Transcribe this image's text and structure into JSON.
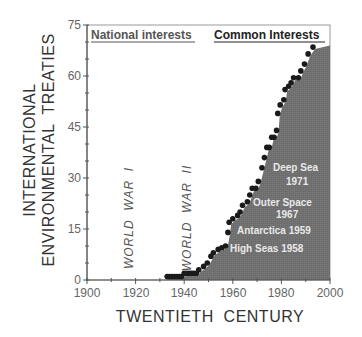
{
  "chart_data": {
    "type": "scatter",
    "title": "",
    "xlabel": "TWENTIETH  CENTURY",
    "ylabel_lines": [
      "INTERNATIONAL",
      "ENVIRONMENTAL  TREATIES"
    ],
    "xlim": [
      1900,
      2000
    ],
    "ylim": [
      0,
      75
    ],
    "x_ticks": [
      1900,
      1920,
      1940,
      1960,
      1980,
      2000
    ],
    "x_minor_step": 10,
    "y_ticks": [
      0,
      15,
      30,
      45,
      60,
      75
    ],
    "y_minor_step": 5,
    "grid": false,
    "legend": null,
    "series": [
      {
        "name": "Cumulative international environmental treaties",
        "marker": "circle",
        "color": "#1a1a1a",
        "fill_under": "#6e6e6e",
        "points": [
          [
            1933,
            1
          ],
          [
            1934,
            1
          ],
          [
            1935,
            1
          ],
          [
            1936,
            1
          ],
          [
            1937,
            1
          ],
          [
            1938,
            1
          ],
          [
            1939,
            1
          ],
          [
            1940,
            2
          ],
          [
            1941,
            2
          ],
          [
            1942,
            2
          ],
          [
            1943,
            2
          ],
          [
            1944,
            2
          ],
          [
            1945,
            2
          ],
          [
            1946,
            3
          ],
          [
            1948,
            4
          ],
          [
            1949.5,
            5
          ],
          [
            1951,
            7
          ],
          [
            1952,
            8
          ],
          [
            1954,
            9
          ],
          [
            1955.5,
            9.5
          ],
          [
            1957,
            10
          ],
          [
            1958,
            14
          ],
          [
            1958.5,
            17
          ],
          [
            1960,
            18
          ],
          [
            1962,
            19
          ],
          [
            1963,
            20
          ],
          [
            1964,
            22
          ],
          [
            1966,
            23
          ],
          [
            1967,
            25
          ],
          [
            1968,
            27
          ],
          [
            1969.5,
            27
          ],
          [
            1970.5,
            29
          ],
          [
            1972,
            33
          ],
          [
            1973,
            36
          ],
          [
            1974,
            39
          ],
          [
            1975,
            39
          ],
          [
            1976,
            42
          ],
          [
            1977,
            42
          ],
          [
            1978,
            44
          ],
          [
            1978.5,
            49
          ],
          [
            1979.5,
            51.5
          ],
          [
            1981,
            53
          ],
          [
            1981.5,
            56
          ],
          [
            1983,
            57
          ],
          [
            1984,
            58
          ],
          [
            1985,
            59.5
          ],
          [
            1987,
            59.5
          ],
          [
            1988,
            61.5
          ],
          [
            1989.5,
            63.5
          ],
          [
            1991,
            66.5
          ],
          [
            1993,
            68.5
          ]
        ],
        "fill_end": [
          2000,
          69
        ]
      }
    ],
    "annotations": [
      {
        "text": "National interests",
        "position": "top-left",
        "style": "bold-underline"
      },
      {
        "text": "Common Interests",
        "position": "top-right",
        "style": "bold-underline"
      },
      {
        "text": "WORLD WAR I",
        "x": 1917,
        "rotation": -90
      },
      {
        "text": "WORLD WAR II",
        "x": 1941,
        "rotation": -90
      },
      {
        "text": "High Seas 1958",
        "x": 1975,
        "y": 9.5
      },
      {
        "text": "Antarctica 1959",
        "x": 1978,
        "y": 15
      },
      {
        "text": "Outer Space",
        "x": 1979,
        "y": 23
      },
      {
        "text": "1967",
        "x": 1982,
        "y": 19.5
      },
      {
        "text": "Deep Sea",
        "x": 1987,
        "y": 33
      },
      {
        "text": "1971",
        "x": 1987,
        "y": 29
      }
    ]
  },
  "header": {
    "left": "National interests",
    "right": "Common Interests"
  },
  "axes": {
    "x_title": "TWENTIETH  CENTURY",
    "y_title_line1": "INTERNATIONAL",
    "y_title_line2": "ENVIRONMENTAL  TREATIES",
    "x_tick_labels": [
      "1900",
      "1920",
      "1940",
      "1960",
      "1980",
      "2000"
    ],
    "y_tick_labels": [
      "0",
      "15",
      "30",
      "45",
      "60",
      "75"
    ]
  },
  "labels": {
    "ww1": "WORLD  WAR  I",
    "ww2": "WORLD  WAR  II",
    "high_seas": "High Seas 1958",
    "antarctica": "Antarctica 1959",
    "outer_space_1": "Outer Space",
    "outer_space_2": "1967",
    "deep_sea_1": "Deep Sea",
    "deep_sea_2": "1971"
  },
  "colors": {
    "fill": "#6e6e6e",
    "dots": "#1a1a1a",
    "axis": "#555555",
    "frame": "#888888",
    "header_text": "#444444"
  }
}
